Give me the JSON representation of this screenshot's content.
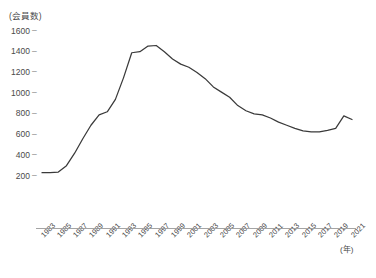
{
  "chart_data": {
    "type": "line",
    "title": "",
    "ylabel": "(会員数)",
    "xlabel": "(年)",
    "ylim": [
      0,
      1600
    ],
    "xlim": [
      1983,
      2021
    ],
    "grid": false,
    "legend": "none",
    "y_ticks": [
      200,
      400,
      600,
      800,
      1000,
      1200,
      1400,
      1600
    ],
    "y_tick_labels": [
      "200",
      "400",
      "600",
      "800",
      "1000",
      "1200",
      "1400",
      "1600"
    ],
    "x_tick_labels": [
      "1983",
      "1985",
      "1987",
      "1989",
      "1991",
      "1993",
      "1995",
      "1997",
      "1999",
      "2001",
      "2003",
      "2005",
      "2007",
      "2009",
      "2011",
      "2013",
      "2015",
      "2017",
      "2019",
      "2021"
    ],
    "line_color": "#3a3a3a",
    "axis_color": "#9a9a9a",
    "x": [
      1983,
      1984,
      1985,
      1986,
      1987,
      1988,
      1989,
      1990,
      1991,
      1992,
      1993,
      1994,
      1995,
      1996,
      1997,
      1998,
      1999,
      2000,
      2001,
      2002,
      2003,
      2004,
      2005,
      2006,
      2007,
      2008,
      2009,
      2010,
      2011,
      2012,
      2013,
      2014,
      2015,
      2016,
      2017,
      2018,
      2019,
      2020,
      2021
    ],
    "values": [
      232,
      232,
      238,
      300,
      420,
      560,
      690,
      790,
      820,
      940,
      1150,
      1390,
      1400,
      1455,
      1460,
      1400,
      1330,
      1280,
      1250,
      1200,
      1140,
      1060,
      1010,
      960,
      880,
      830,
      800,
      790,
      760,
      720,
      690,
      660,
      635,
      625,
      625,
      640,
      660,
      780,
      745
    ],
    "series": [
      {
        "name": "会員数",
        "values": [
          232,
          232,
          238,
          300,
          420,
          560,
          690,
          790,
          820,
          940,
          1150,
          1390,
          1400,
          1455,
          1460,
          1400,
          1330,
          1280,
          1250,
          1200,
          1140,
          1060,
          1010,
          960,
          880,
          830,
          800,
          790,
          760,
          720,
          690,
          660,
          635,
          625,
          625,
          640,
          660,
          780,
          745
        ]
      }
    ]
  },
  "figure": {
    "y_axis_title": "(会員数)",
    "x_axis_title": "(年)"
  }
}
